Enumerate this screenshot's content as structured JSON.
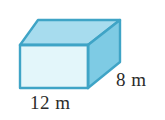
{
  "figure": {
    "type": "rectangular-prism",
    "background_color": "#ffffff",
    "faces": {
      "front": {
        "name": "front-face",
        "fill": "#e3f6fa",
        "points": "20,45 88,45 88,88 20,88"
      },
      "top": {
        "name": "top-face",
        "fill": "#a7dcee",
        "points": "20,45 38,20 120,20 88,45"
      },
      "right": {
        "name": "right-face",
        "fill": "#7ecbe4",
        "points": "88,45 120,20 120,62 88,88"
      }
    },
    "edge_color": "#3fa4c6",
    "edge_width": 2.4
  },
  "labels": {
    "length": "12 m",
    "depth": "8 m"
  },
  "measurements": {
    "length_value": 12,
    "length_unit": "m",
    "depth_value": 8,
    "depth_unit": "m"
  }
}
